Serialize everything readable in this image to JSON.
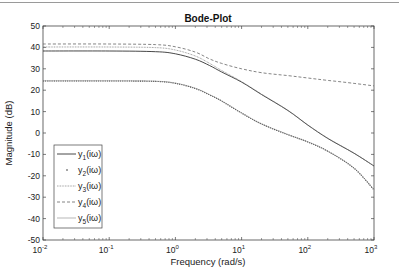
{
  "chart_data": {
    "type": "line",
    "title": "Bode-Plot",
    "xlabel": "Frequency (rad/s)",
    "ylabel": "Magnitude (dB)",
    "xscale": "log",
    "xlim": [
      0.01,
      1000
    ],
    "ylim": [
      -50,
      50
    ],
    "xticks": [
      0.01,
      0.1,
      1,
      10,
      100,
      1000
    ],
    "xtick_labels": [
      "10^-2",
      "10^-1",
      "10^0",
      "10^1",
      "10^2",
      "10^3"
    ],
    "yticks": [
      50,
      40,
      30,
      20,
      10,
      0,
      -10,
      -20,
      -30,
      -40,
      -50
    ],
    "grid": false,
    "legend_position": "lower left",
    "x": [
      0.01,
      0.1,
      0.5,
      1,
      2,
      3.3,
      5,
      10,
      20,
      50,
      100,
      200,
      500,
      1000
    ],
    "series": [
      {
        "name": "y1(iω)",
        "style": "solid",
        "values": [
          38.3,
          38.3,
          38.0,
          37.0,
          34.5,
          31.5,
          28.5,
          23.8,
          18.0,
          10.5,
          3.7,
          -2.5,
          -9.5,
          -15.4
        ]
      },
      {
        "name": "y2(iω)",
        "style": "dotted",
        "values": [
          24.3,
          24.3,
          24.1,
          23.2,
          20.8,
          17.8,
          14.9,
          9.3,
          4.2,
          -0.8,
          -4.2,
          -8.5,
          -16.5,
          -26.6
        ]
      },
      {
        "name": "y3(iω)",
        "style": "dotted-fine",
        "values": [
          40.2,
          40.2,
          39.9,
          38.8,
          36.0,
          32.5,
          29.2,
          24.0,
          18.2,
          10.6,
          3.8,
          -2.4,
          -9.4,
          -15.4
        ]
      },
      {
        "name": "y4(iω)",
        "style": "dashed",
        "values": [
          41.6,
          41.6,
          41.3,
          40.3,
          37.8,
          34.6,
          32.5,
          30.0,
          28.2,
          26.8,
          25.7,
          24.6,
          23.2,
          22.0
        ]
      },
      {
        "name": "y5(iω)",
        "style": "thin-solid",
        "values": [
          24.4,
          24.4,
          24.2,
          23.3,
          20.9,
          17.9,
          15.0,
          9.4,
          4.3,
          -0.7,
          -4.1,
          -8.4,
          -16.4,
          -26.5
        ]
      }
    ]
  },
  "labels": {
    "title": "Bode-Plot",
    "xlabel": "Frequency (rad/s)",
    "ylabel": "Magnitude (dB)",
    "yticks": [
      "50",
      "40",
      "30",
      "20",
      "10",
      "0",
      "-10",
      "-20",
      "-30",
      "-40",
      "-50"
    ],
    "legend": [
      {
        "base": "y",
        "sub": "1",
        "suffix": "(iω)"
      },
      {
        "base": "y",
        "sub": "2",
        "suffix": "(iω)"
      },
      {
        "base": "y",
        "sub": "3",
        "suffix": "(iω)"
      },
      {
        "base": "y",
        "sub": "4",
        "suffix": "(iω)"
      },
      {
        "base": "y",
        "sub": "5",
        "suffix": "(iω)"
      }
    ],
    "xtick_base": "10",
    "xtick_exps": [
      "-2",
      "-1",
      "0",
      "1",
      "2",
      "3"
    ]
  },
  "colors": {
    "line": "#555555",
    "axis": "#444444",
    "dashed": "#666666"
  }
}
